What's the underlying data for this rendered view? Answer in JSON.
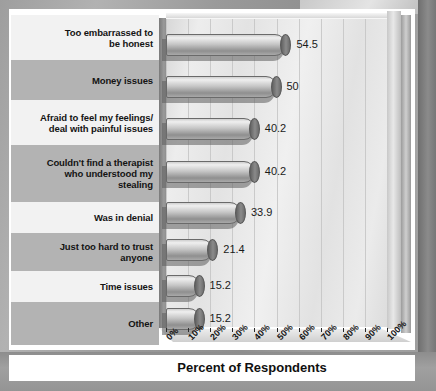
{
  "chart_data": {
    "type": "bar",
    "orientation": "horizontal",
    "title": "",
    "xlabel": "Percent of Respondents",
    "ylabel": "",
    "xlim": [
      0,
      100
    ],
    "grid": true,
    "legend": null,
    "categories": [
      "Too embarrassed to be honest",
      "Money issues",
      "Afraid to feel my feelings/ deal with painful issues",
      "Couldn't find a therapist who understood my stealing",
      "Was in denial",
      "Just too hard to trust anyone",
      "Time issues",
      "Other"
    ],
    "values": [
      54.5,
      50,
      40.2,
      40.2,
      33.9,
      21.4,
      15.2,
      15.2
    ],
    "value_labels": [
      "54.5",
      "50",
      "40.2",
      "40.2",
      "33.9",
      "21.4",
      "15.2",
      "15.2"
    ],
    "xticks": [
      0,
      10,
      20,
      30,
      40,
      50,
      60,
      70,
      80,
      90,
      100
    ],
    "xticklabels": [
      "0%",
      "10%",
      "20%",
      "30%",
      "40%",
      "50%",
      "60%",
      "70%",
      "80%",
      "90%",
      "100%"
    ]
  },
  "categories_lines": [
    [
      "Too embarrassed to",
      "be honest"
    ],
    [
      "Money issues"
    ],
    [
      "Afraid to feel my feelings/",
      "deal with painful issues"
    ],
    [
      "Couldn't find a therapist",
      "who understood my",
      "stealing"
    ],
    [
      "Was in denial"
    ],
    [
      "Just too hard to trust",
      "anyone"
    ],
    [
      "Time issues"
    ],
    [
      "Other"
    ]
  ],
  "axis": {
    "title": "Percent of Respondents"
  },
  "colors": {
    "band_alt": "#b3b3b3",
    "band_plain": "#f2f2f2",
    "bar_light": "#efefef",
    "bar_dark": "#8f8f8f",
    "cap": "#6b6b6b",
    "background": "#a8a8a8",
    "card": "#ffffff",
    "plot_wall": "#e9e9e9",
    "gridline": "#c4c4c4",
    "text": "#141414"
  }
}
